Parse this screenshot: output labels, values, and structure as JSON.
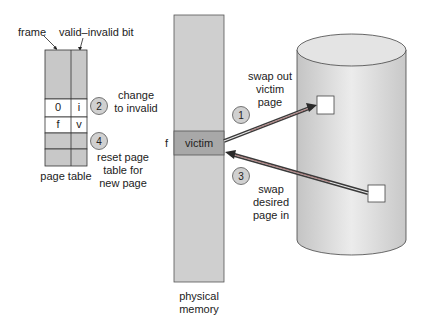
{
  "page_table": {
    "frame_label": "frame",
    "valid_bit_label": "valid–invalid bit",
    "caption": "page table",
    "rows": [
      {
        "frame": "",
        "bit": "",
        "filled": true
      },
      {
        "frame": "0",
        "bit": "i",
        "filled": false
      },
      {
        "frame": "f",
        "bit": "v",
        "filled": false
      },
      {
        "frame": "",
        "bit": "",
        "filled": true
      },
      {
        "frame": "",
        "bit": "",
        "filled": true
      }
    ]
  },
  "steps": [
    {
      "number": "1",
      "text_lines": [
        "swap out",
        "victim",
        "page"
      ]
    },
    {
      "number": "2",
      "text_lines": [
        "change",
        "to invalid"
      ]
    },
    {
      "number": "3",
      "text_lines": [
        "swap",
        "desired",
        "page in"
      ]
    },
    {
      "number": "4",
      "text_lines": [
        "reset page",
        "table for",
        "new page"
      ]
    }
  ],
  "physical_memory": {
    "caption_lines": [
      "physical",
      "memory"
    ],
    "victim_label": "victim",
    "frame_marker": "f"
  },
  "colors": {
    "gray_fill": "#c8c8c8",
    "victim_fill": "#a8a8a8",
    "arrow_dark": "#3a3a3a",
    "arrow_accent": "#b05a5a",
    "disk_fill": "#d9d9d9",
    "circle_fill": "#d0d0d0"
  }
}
